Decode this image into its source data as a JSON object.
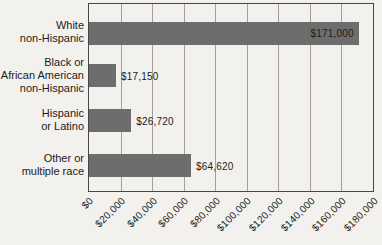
{
  "chart_data": {
    "type": "bar",
    "orientation": "horizontal",
    "title": "",
    "xlabel": "",
    "ylabel": "",
    "categories": [
      "White non-Hispanic",
      "Black or African American non-Hispanic",
      "Hispanic or Latino",
      "Other or multiple race"
    ],
    "category_display": [
      "White\nnon-Hispanic",
      "Black or\nAfrican American\nnon-Hispanic",
      "Hispanic\nor Latino",
      "Other or\nmultiple race"
    ],
    "values": [
      171000,
      17150,
      26720,
      64620
    ],
    "value_labels": [
      "$171,000",
      "$17,150",
      "$26,720",
      "$64,620"
    ],
    "value_label_position": [
      "inside-end",
      "outside-end",
      "outside-end",
      "outside-end"
    ],
    "xlim": [
      0,
      180000
    ],
    "tick_step": 20000,
    "tick_labels": [
      "$0",
      "$20,000",
      "$40,000",
      "$60,000",
      "$80,000",
      "$100,000",
      "$120,000",
      "$140,000",
      "$160,000",
      "$180,000"
    ],
    "grid": true,
    "legend": false,
    "colors": {
      "background": "#f3f1ed",
      "bar": "#6d6d6d",
      "gridline": "#a39f99",
      "border": "#474747",
      "text": "#1c1c1c"
    }
  }
}
